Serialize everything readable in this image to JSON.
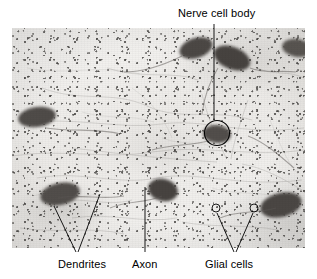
{
  "figure": {
    "type": "light-micrograph",
    "plate": {
      "left": 12,
      "top": 28,
      "width": 293,
      "height": 220,
      "background_color": "#f1f0ee",
      "stain_color": "#282624"
    },
    "annotation_color": "#000000",
    "labels": [
      {
        "id": "nerve-cell-body",
        "text": "Nerve cell body",
        "position": "top-right",
        "x": 178,
        "y": 7,
        "pointer": "line-down-to-circled-soma"
      },
      {
        "id": "dendrites",
        "text": "Dendrites",
        "position": "bottom-left",
        "x": 58,
        "y": 258,
        "pointer": "two-line-v-fork"
      },
      {
        "id": "axon",
        "text": "Axon",
        "position": "bottom-center",
        "x": 132,
        "y": 258,
        "pointer": "single-vertical-line"
      },
      {
        "id": "glial-cells",
        "text": "Glial cells",
        "position": "bottom-right",
        "x": 205,
        "y": 258,
        "pointer": "two-line-v-fork-to-small-circles"
      }
    ],
    "markers": [
      {
        "id": "soma-circle",
        "shape": "circle",
        "cx": 217,
        "cy": 133,
        "r": 12.5
      },
      {
        "id": "glial-circle-left",
        "shape": "circle",
        "cx": 216,
        "cy": 208,
        "r": 4
      },
      {
        "id": "glial-circle-right",
        "shape": "circle",
        "cx": 254,
        "cy": 208,
        "r": 4
      }
    ],
    "cells": [
      {
        "id": "soma-top-left",
        "cx": 196,
        "cy": 48,
        "rx": 17,
        "ry": 10,
        "rot": -18
      },
      {
        "id": "soma-top-right",
        "cx": 232,
        "cy": 58,
        "rx": 19,
        "ry": 11,
        "rot": 22
      },
      {
        "id": "soma-far-right",
        "cx": 298,
        "cy": 48,
        "rx": 14,
        "ry": 9,
        "rot": 10
      },
      {
        "id": "soma-mid-left",
        "cx": 37,
        "cy": 117,
        "rx": 19,
        "ry": 10,
        "rot": -8
      },
      {
        "id": "soma-circled",
        "cx": 217,
        "cy": 134,
        "rx": 14,
        "ry": 9,
        "rot": 6
      },
      {
        "id": "soma-lower-left",
        "cx": 60,
        "cy": 194,
        "rx": 20,
        "ry": 11,
        "rot": -12
      },
      {
        "id": "soma-lower-center",
        "cx": 163,
        "cy": 190,
        "rx": 15,
        "ry": 11,
        "rot": 14
      },
      {
        "id": "soma-lower-right",
        "cx": 281,
        "cy": 205,
        "rx": 21,
        "ry": 12,
        "rot": -14
      }
    ]
  }
}
